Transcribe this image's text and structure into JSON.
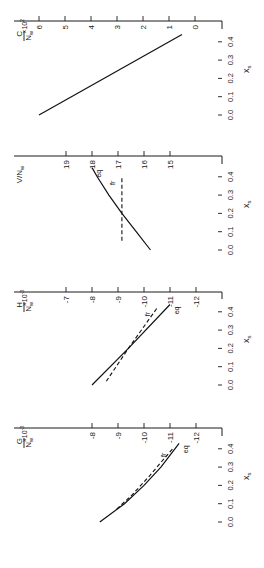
{
  "figure": {
    "orientation": "rotated 90 degrees counterclockwise",
    "x_axis_label": "x",
    "x_axis_subscript": "s",
    "x_ticks": [
      "0.0",
      "0.1",
      "0.2",
      "0.3",
      "0.4"
    ],
    "series_labels": {
      "eq": "eq",
      "fr": "fr"
    }
  },
  "chart_data": [
    {
      "type": "line",
      "panel": "G",
      "title": "",
      "ylabel": "G/N_w × 10^-3",
      "ylabel_num": "G",
      "ylabel_den": "N",
      "ylabel_den_sub": "w",
      "ylabel_mult": "×10",
      "ylabel_exp": "-3",
      "xlabel": "x_s",
      "xlim": [
        0.0,
        0.45
      ],
      "ylim": [
        -7,
        -13
      ],
      "y_ticks": [
        "-8",
        "-9",
        "-10",
        "-11",
        "-12"
      ],
      "y_tick_values": [
        -8,
        -9,
        -10,
        -11,
        -12
      ],
      "series": [
        {
          "name": "eq",
          "style": "solid",
          "x": [
            0.0,
            0.1,
            0.2,
            0.3,
            0.43
          ],
          "y": [
            -8.3,
            -9.25,
            -10.0,
            -10.65,
            -11.35
          ]
        },
        {
          "name": "fr",
          "style": "dashed",
          "x": [
            0.07,
            0.15,
            0.25,
            0.35,
            0.4
          ],
          "y": [
            -8.95,
            -9.55,
            -10.2,
            -10.8,
            -11.1
          ]
        }
      ]
    },
    {
      "type": "line",
      "panel": "H",
      "title": "",
      "ylabel": "H/N_w × 10^-3",
      "ylabel_num": "H",
      "ylabel_den": "N",
      "ylabel_den_sub": "w",
      "ylabel_mult": "×10",
      "ylabel_exp": "-3",
      "xlabel": "x_s",
      "xlim": [
        0.0,
        0.45
      ],
      "ylim": [
        -6,
        -13
      ],
      "y_ticks": [
        "-7",
        "-8",
        "-9",
        "-10",
        "-11",
        "-12"
      ],
      "y_tick_values": [
        -7,
        -8,
        -9,
        -10,
        -11,
        -12
      ],
      "series": [
        {
          "name": "eq",
          "style": "solid",
          "x": [
            0.0,
            0.2,
            0.44
          ],
          "y": [
            -8.0,
            -9.4,
            -11.0
          ]
        },
        {
          "name": "fr",
          "style": "dashed",
          "x": [
            0.02,
            0.2,
            0.42
          ],
          "y": [
            -8.55,
            -9.4,
            -10.5
          ]
        }
      ]
    },
    {
      "type": "line",
      "panel": "V",
      "title": "",
      "ylabel": "V/N_w",
      "ylabel_num": "V/N",
      "ylabel_den": "",
      "ylabel_den_sub": "w",
      "ylabel_mult": "",
      "ylabel_exp": "",
      "xlabel": "x_s",
      "xlim": [
        0.0,
        0.45
      ],
      "ylim": [
        20,
        14
      ],
      "y_ticks": [
        "19",
        "18",
        "17",
        "16",
        "15"
      ],
      "y_tick_values": [
        19,
        18,
        17,
        16,
        15
      ],
      "series": [
        {
          "name": "eq",
          "style": "solid",
          "x": [
            0.0,
            0.1,
            0.2,
            0.3,
            0.4,
            0.45
          ],
          "y": [
            15.75,
            16.3,
            16.85,
            17.35,
            17.8,
            18.0
          ]
        },
        {
          "name": "fr",
          "style": "dashed",
          "x": [
            0.05,
            0.4
          ],
          "y": [
            16.85,
            16.85
          ]
        }
      ]
    },
    {
      "type": "line",
      "panel": "C",
      "title": "",
      "ylabel": "C/N_w × 10^2",
      "ylabel_num": "C",
      "ylabel_den": "N",
      "ylabel_den_sub": "w",
      "ylabel_mult": "×10",
      "ylabel_exp": "2",
      "xlabel": "x_s",
      "xlim": [
        0.0,
        0.45
      ],
      "ylim": [
        7,
        -1
      ],
      "y_ticks": [
        "6",
        "5",
        "4",
        "3",
        "2",
        "1",
        "0"
      ],
      "y_tick_values": [
        6,
        5,
        4,
        3,
        2,
        1,
        0
      ],
      "series": [
        {
          "name": "eq",
          "style": "solid",
          "x": [
            0.0,
            0.44
          ],
          "y": [
            6.0,
            0.5
          ]
        }
      ]
    }
  ]
}
